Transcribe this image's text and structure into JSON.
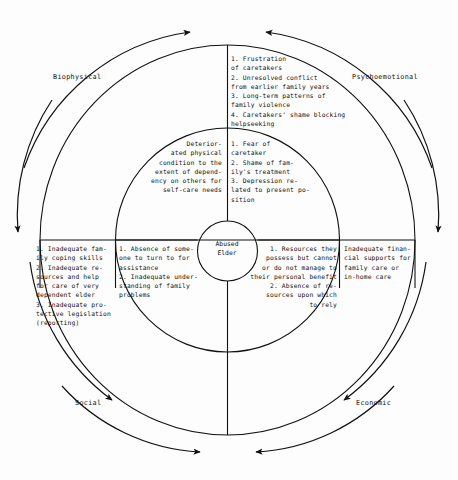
{
  "diagram": {
    "center": {
      "line1": "Abused",
      "line2": "Elder"
    },
    "quadrant_labels": {
      "biophysical": "Biophysical",
      "psychoemotional": "Psychoemotional",
      "social": "Social",
      "economic": "Economic"
    },
    "rings": {
      "inner_biophysical": "Deterior-\nated physical\ncondition to the\nextent of depend-\nency on others for\nself-care needs",
      "inner_psychoemotional": "1. Fear of\ncaretaker\n2. Shame of fam-\nily's treatment\n3. Depression re-\nlated to present po-\nsition",
      "outer_psychoemotional": "1. Frustration\nof caretakers\n2. Unresolved conflict\nfrom earlier family years\n3. Long-term patterns of\nfamily violence\n4. Caretakers' shame blocking\n        helpseeking",
      "inner_social": "1. Absence of some-\none to turn to for\nassistance\n  2. Inadequate under-\nstanding of family\n     problems",
      "outer_social": "1. Inadequate fam-\nily coping skills\n 2. Inadequate re-\nsources and help\n for care of very\n dependent elder\n  3. Inadequate pro-\n    tective legislation\n   (reporting)",
      "inner_economic": "1. Resources they\npossess but cannot\nor do not manage to\ntheir personal benefit\n2. Absence of re-\nsources upon which\nto rely",
      "outer_economic": "Inadequate finan-\ncial supports for\nfamily care or\nin-home care"
    },
    "colors": {
      "stroke": "#111111",
      "background": "#ffffff",
      "text": "#111111"
    }
  }
}
